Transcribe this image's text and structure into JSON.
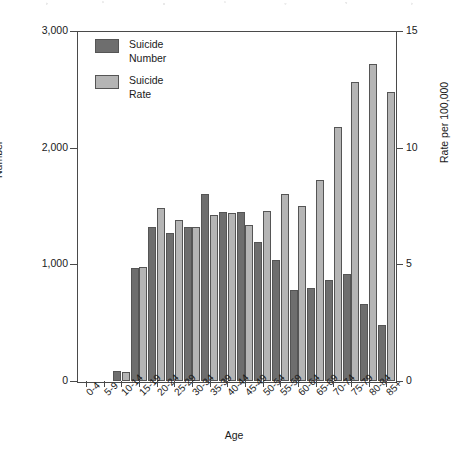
{
  "chart_data": {
    "type": "bar",
    "title": "",
    "subtitle": "",
    "xlabel": "Age",
    "ylabel": "Number",
    "y2label": "Rate per 100,000",
    "ylim": [
      0,
      3000
    ],
    "y2lim": [
      0,
      15
    ],
    "yticks": [
      "0",
      "1,000",
      "2,000",
      "3,000"
    ],
    "ytick_values": [
      0,
      1000,
      2000,
      3000
    ],
    "y2ticks": [
      "0",
      "5",
      "10",
      "15"
    ],
    "y2tick_values": [
      0,
      5,
      10,
      15
    ],
    "grid": false,
    "legend_position": "top-left",
    "categories": [
      "0-4",
      "5-9",
      "10-14",
      "15-19",
      "20-24",
      "25-29",
      "30-34",
      "35-39",
      "40-44",
      "45-49",
      "50-54",
      "55-59",
      "60-64",
      "65-69",
      "70-74",
      "75-79",
      "80-84",
      "85+"
    ],
    "series": [
      {
        "name": "Suicide Number",
        "axis": "left",
        "color": "#6e6e6e",
        "unit": "count",
        "values": [
          0,
          0,
          90,
          970,
          1320,
          1270,
          1320,
          1600,
          1450,
          1450,
          1190,
          1040,
          780,
          800,
          870,
          920,
          660,
          480
        ]
      },
      {
        "name": "Suicide Rate",
        "axis": "right",
        "color": "#b5b5b5",
        "unit": "per 100,000",
        "values": [
          0.0,
          0.0,
          0.4,
          4.9,
          7.4,
          6.9,
          6.6,
          7.1,
          7.2,
          6.7,
          7.3,
          8.0,
          7.5,
          8.6,
          10.9,
          12.8,
          13.6,
          12.4
        ]
      }
    ],
    "series_scaled_to_left_axis": {
      "Suicide Rate": [
        0,
        0,
        80,
        980,
        1480,
        1380,
        1320,
        1420,
        1440,
        1340,
        1460,
        1620,
        1500,
        1720,
        2180,
        2570,
        2720,
        2480
      ]
    }
  },
  "legend": {
    "items": [
      {
        "label_line1": "Suicide",
        "label_line2": "Number",
        "swatch": "dark-gray-swatch"
      },
      {
        "label_line1": "Suicide",
        "label_line2": "Rate",
        "swatch": "light-gray-swatch"
      }
    ]
  }
}
